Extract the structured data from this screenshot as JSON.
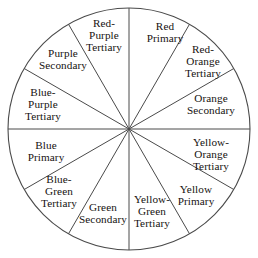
{
  "figure": {
    "name": "twelve-part-color-wheel",
    "background_color": "#ffffff",
    "stroke_color": "#4a4a4a",
    "text_color": "#16120f",
    "geometry": {
      "center_x": 129,
      "center_y": 129,
      "radius": 121,
      "sector_count": 12,
      "sector_degrees": 30,
      "label_radius_fraction": 0.72
    }
  },
  "chart_data": {
    "type": "pie",
    "categories": [
      "Red",
      "Red-Orange",
      "Orange",
      "Yellow-Orange",
      "Yellow",
      "Yellow-Green",
      "Green",
      "Blue-Green",
      "Blue",
      "Blue-Purple",
      "Purple",
      "Red-Purple"
    ],
    "values": [
      30,
      30,
      30,
      30,
      30,
      30,
      30,
      30,
      30,
      30,
      30,
      30
    ],
    "legend_position": "none",
    "grid": false
  },
  "sectors": [
    {
      "id": "red-primary",
      "lines": [
        "Red",
        "Primary"
      ],
      "color_name": "Red",
      "category": "Primary",
      "start_angle": 0,
      "end_angle": 30,
      "label_x": 165,
      "label_y": 33
    },
    {
      "id": "red-orange-tertiary",
      "lines": [
        "Red-",
        "Orange",
        "Tertiary"
      ],
      "color_name": "Red-Orange",
      "category": "Tertiary",
      "start_angle": 30,
      "end_angle": 60,
      "label_x": 203,
      "label_y": 62
    },
    {
      "id": "orange-secondary",
      "lines": [
        "Orange",
        "Secondary"
      ],
      "color_name": "Orange",
      "category": "Secondary",
      "start_angle": 60,
      "end_angle": 90,
      "label_x": 211,
      "label_y": 105
    },
    {
      "id": "yellow-orange-tertiary",
      "lines": [
        "Yellow-",
        "Orange",
        "Tertiary"
      ],
      "color_name": "Yellow-Orange",
      "category": "Tertiary",
      "start_angle": 90,
      "end_angle": 120,
      "label_x": 211,
      "label_y": 155
    },
    {
      "id": "yellow-primary",
      "lines": [
        "Yellow",
        "Primary"
      ],
      "color_name": "Yellow",
      "category": "Primary",
      "start_angle": 120,
      "end_angle": 150,
      "label_x": 196,
      "label_y": 196
    },
    {
      "id": "yellow-green-tertiary",
      "lines": [
        "Yellow-",
        "Green",
        "Tertiary"
      ],
      "color_name": "Yellow-Green",
      "category": "Tertiary",
      "start_angle": 150,
      "end_angle": 180,
      "label_x": 152,
      "label_y": 212
    },
    {
      "id": "green-secondary",
      "lines": [
        "Green",
        "Secondary"
      ],
      "color_name": "Green",
      "category": "Secondary",
      "start_angle": 180,
      "end_angle": 210,
      "label_x": 103,
      "label_y": 214
    },
    {
      "id": "blue-green-tertiary",
      "lines": [
        "Blue-",
        "Green",
        "Tertiary"
      ],
      "color_name": "Blue-Green",
      "category": "Tertiary",
      "start_angle": 210,
      "end_angle": 240,
      "label_x": 59,
      "label_y": 192
    },
    {
      "id": "blue-primary",
      "lines": [
        "Blue",
        "Primary"
      ],
      "color_name": "Blue",
      "category": "Primary",
      "start_angle": 240,
      "end_angle": 270,
      "label_x": 46,
      "label_y": 152
    },
    {
      "id": "blue-purple-tertiary",
      "lines": [
        "Blue-",
        "Purple",
        "Tertiary"
      ],
      "color_name": "Blue-Purple",
      "category": "Tertiary",
      "start_angle": 270,
      "end_angle": 300,
      "label_x": 43,
      "label_y": 105
    },
    {
      "id": "purple-secondary",
      "lines": [
        "Purple",
        "Secondary"
      ],
      "color_name": "Purple",
      "category": "Secondary",
      "start_angle": 300,
      "end_angle": 330,
      "label_x": 63,
      "label_y": 60
    },
    {
      "id": "red-purple-tertiary",
      "lines": [
        "Red-",
        "Purple",
        "Tertiary"
      ],
      "color_name": "Red-Purple",
      "category": "Tertiary",
      "start_angle": 330,
      "end_angle": 360,
      "label_x": 104,
      "label_y": 36
    }
  ]
}
